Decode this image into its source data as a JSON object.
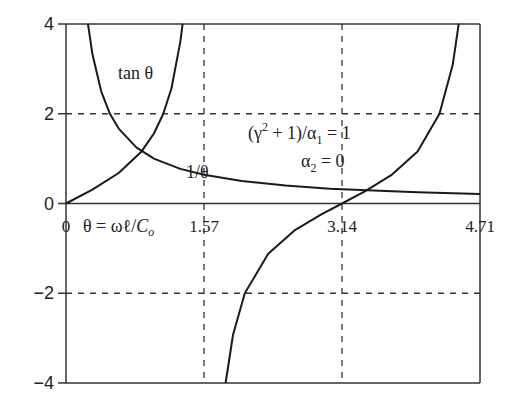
{
  "chart_data": {
    "type": "line",
    "title": "",
    "xlabel": "θ = ωℓ/Co",
    "ylabel": "",
    "xlim": [
      0,
      4.71
    ],
    "ylim": [
      -4,
      4
    ],
    "x_ticks": [
      "0",
      "1.57",
      "3.14",
      "4.71"
    ],
    "x_tick_values": [
      0,
      1.57,
      3.14,
      4.71
    ],
    "y_ticks": [
      "4",
      "2",
      "0",
      "−2",
      "−4"
    ],
    "y_tick_values": [
      4,
      2,
      0,
      -2,
      -4
    ],
    "grid": {
      "dashed_x": [
        1.57,
        3.14
      ],
      "dashed_y": [
        2,
        -2
      ]
    },
    "series": [
      {
        "name": "tan θ",
        "branches": [
          {
            "x": [
              0,
              0.3,
              0.6,
              0.86,
              1.0,
              1.107,
              1.2,
              1.3,
              1.326
            ],
            "y": [
              0,
              0.31,
              0.68,
              1.16,
              1.56,
              2.0,
              2.57,
              3.6,
              4.0
            ]
          },
          {
            "x": [
              1.816,
              1.9,
              2.034,
              2.3,
              2.6,
              2.9,
              3.14,
              3.4,
              3.7,
              4.0,
              4.249,
              4.4,
              4.468
            ],
            "y": [
              -4.0,
              -2.93,
              -2.0,
              -1.12,
              -0.6,
              -0.25,
              0,
              0.27,
              0.63,
              1.16,
              2.0,
              3.1,
              4.0
            ]
          }
        ]
      },
      {
        "name": "1/θ",
        "x": [
          0.25,
          0.3,
          0.4,
          0.5,
          0.6,
          0.8,
          1.0,
          1.3,
          1.57,
          2.0,
          2.5,
          3.0,
          3.5,
          4.0,
          4.71
        ],
        "y": [
          4.0,
          3.33,
          2.5,
          2.0,
          1.67,
          1.25,
          1.0,
          0.77,
          0.64,
          0.5,
          0.4,
          0.33,
          0.29,
          0.25,
          0.21
        ]
      }
    ],
    "annotations": [
      {
        "text": "tan θ",
        "x": 1.1,
        "y": 3.2
      },
      {
        "text": "1/θ",
        "x": 1.55,
        "y": 0.78
      },
      {
        "text": "θ = ωℓ/Co",
        "x": 0.35,
        "y": -0.45
      },
      {
        "text": "(γ² + 1)/α₁ = 1",
        "x": 2.3,
        "y": 1.4
      },
      {
        "text": "α₂ = 0",
        "x": 2.92,
        "y": 0.75
      }
    ]
  },
  "labels": {
    "tan": "tan θ",
    "inv": "1/θ",
    "theta_def_prefix": "θ = ωℓ/",
    "theta_def_c": "C",
    "theta_def_sub": "o",
    "param1_a": "(γ",
    "param1_sup": "2",
    "param1_b": " + 1)/α",
    "param1_sub": "1",
    "param1_c": " = 1",
    "param2_a": "α",
    "param2_sub": "2",
    "param2_b": " = 0"
  }
}
